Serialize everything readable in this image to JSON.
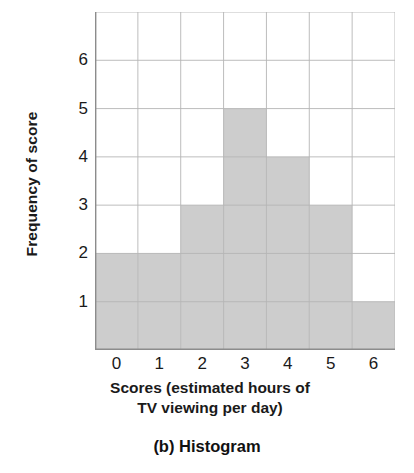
{
  "chart_data": {
    "type": "bar",
    "title": "(b) Histogram",
    "xlabel_line1": "Scores (estimated hours of",
    "xlabel_line2": "TV viewing per day)",
    "ylabel": "Frequency of score",
    "categories": [
      "0",
      "1",
      "2",
      "3",
      "4",
      "5",
      "6"
    ],
    "values": [
      2,
      2,
      3,
      5,
      4,
      3,
      1
    ],
    "xtick_labels": [
      "0",
      "1",
      "2",
      "3",
      "4",
      "5",
      "6"
    ],
    "ytick_labels": [
      "1",
      "2",
      "3",
      "4",
      "5",
      "6"
    ],
    "ytick_values": [
      1,
      2,
      3,
      4,
      5,
      6
    ],
    "ylim": [
      0,
      7
    ],
    "xlim": [
      -0.5,
      6.5
    ],
    "grid": true,
    "legend": "none",
    "bar_fill_color": "#cdcdcd",
    "bar_edge_color": "#9a9a9a",
    "grid_color": "#b5b5b5",
    "axis_color": "#8c8c8c",
    "background_color": "#ffffff",
    "text_color": "#1a1a1a"
  }
}
